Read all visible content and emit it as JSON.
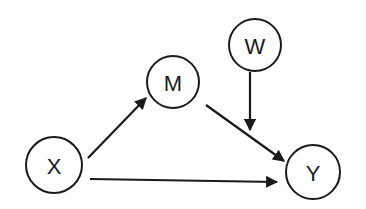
{
  "diagram": {
    "type": "path-diagram",
    "nodes": [
      {
        "id": "X",
        "label": "X",
        "cx": 54,
        "cy": 165,
        "r": 28
      },
      {
        "id": "M",
        "label": "M",
        "cx": 173,
        "cy": 82,
        "r": 26
      },
      {
        "id": "W",
        "label": "W",
        "cx": 255,
        "cy": 45,
        "r": 26
      },
      {
        "id": "Y",
        "label": "Y",
        "cx": 313,
        "cy": 172,
        "r": 27
      }
    ],
    "edges": [
      {
        "from": "X",
        "to": "M",
        "x1": 88,
        "y1": 158,
        "x2": 146,
        "y2": 98
      },
      {
        "from": "M",
        "to": "Y",
        "x1": 206,
        "y1": 105,
        "x2": 284,
        "y2": 161
      },
      {
        "from": "W",
        "to": "M-Y path",
        "x1": 250,
        "y1": 72,
        "x2": 250,
        "y2": 130
      },
      {
        "from": "X",
        "to": "Y",
        "x1": 90,
        "y1": 179,
        "x2": 277,
        "y2": 182
      }
    ],
    "colors": {
      "stroke": "#1a1a1a",
      "background": "#ffffff"
    }
  }
}
